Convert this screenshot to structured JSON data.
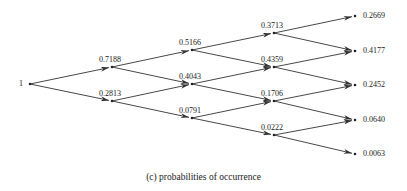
{
  "diagram": {
    "type": "binomial-tree",
    "caption": "(c) probabilities of occurrence",
    "root": {
      "id": "n0",
      "label": "1",
      "x": 30,
      "y": 84
    },
    "nodes": [
      {
        "id": "n0",
        "label": "1",
        "x": 30,
        "y": 84,
        "label_pos": "left"
      },
      {
        "id": "a0",
        "label": "0.7188",
        "x": 112,
        "y": 67,
        "label_pos": "above"
      },
      {
        "id": "a1",
        "label": "0.2813",
        "x": 112,
        "y": 101,
        "label_pos": "above"
      },
      {
        "id": "b0",
        "label": "0.5166",
        "x": 192,
        "y": 50,
        "label_pos": "above"
      },
      {
        "id": "b1",
        "label": "0.4043",
        "x": 192,
        "y": 84,
        "label_pos": "above"
      },
      {
        "id": "b2",
        "label": "0.0791",
        "x": 192,
        "y": 118,
        "label_pos": "above"
      },
      {
        "id": "c0",
        "label": "0.3713",
        "x": 274,
        "y": 33,
        "label_pos": "above"
      },
      {
        "id": "c1",
        "label": "0.4359",
        "x": 274,
        "y": 67,
        "label_pos": "above"
      },
      {
        "id": "c2",
        "label": "0.1706",
        "x": 274,
        "y": 101,
        "label_pos": "above"
      },
      {
        "id": "c3",
        "label": "0.0222",
        "x": 274,
        "y": 135,
        "label_pos": "above"
      },
      {
        "id": "d0",
        "label": "0.2669",
        "x": 355,
        "y": 16,
        "label_pos": "right"
      },
      {
        "id": "d1",
        "label": "0.4177",
        "x": 355,
        "y": 51,
        "label_pos": "right"
      },
      {
        "id": "d2",
        "label": "0.2452",
        "x": 355,
        "y": 85,
        "label_pos": "right"
      },
      {
        "id": "d3",
        "label": "0.0640",
        "x": 355,
        "y": 120,
        "label_pos": "right"
      },
      {
        "id": "d4",
        "label": "0.0063",
        "x": 355,
        "y": 154,
        "label_pos": "right"
      }
    ],
    "edges": [
      [
        "n0",
        "a0"
      ],
      [
        "n0",
        "a1"
      ],
      [
        "a0",
        "b0"
      ],
      [
        "a0",
        "b1"
      ],
      [
        "a1",
        "b1"
      ],
      [
        "a1",
        "b2"
      ],
      [
        "b0",
        "c0"
      ],
      [
        "b0",
        "c1"
      ],
      [
        "b1",
        "c1"
      ],
      [
        "b1",
        "c2"
      ],
      [
        "b2",
        "c2"
      ],
      [
        "b2",
        "c3"
      ],
      [
        "c0",
        "d0"
      ],
      [
        "c0",
        "d1"
      ],
      [
        "c1",
        "d1"
      ],
      [
        "c1",
        "d2"
      ],
      [
        "c2",
        "d2"
      ],
      [
        "c2",
        "d3"
      ],
      [
        "c3",
        "d3"
      ],
      [
        "c3",
        "d4"
      ]
    ],
    "line_color": "#333333"
  }
}
